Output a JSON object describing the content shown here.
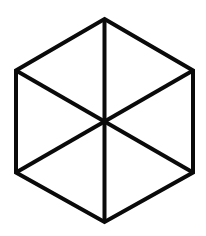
{
  "figure": {
    "type": "hexagon-with-diagonals",
    "background": "#ffffff",
    "stroke_color": "#0a0a0a",
    "stroke_width": 4,
    "vertices": {
      "top": [
        104.5,
        19
      ],
      "upper_right": [
        193,
        70.5
      ],
      "lower_right": [
        193,
        172.5
      ],
      "bottom": [
        104.5,
        222
      ],
      "lower_left": [
        16,
        172.5
      ],
      "upper_left": [
        16,
        70.5
      ]
    },
    "center": [
      104.5,
      121
    ],
    "edges_count": 6,
    "spokes_count": 6
  }
}
